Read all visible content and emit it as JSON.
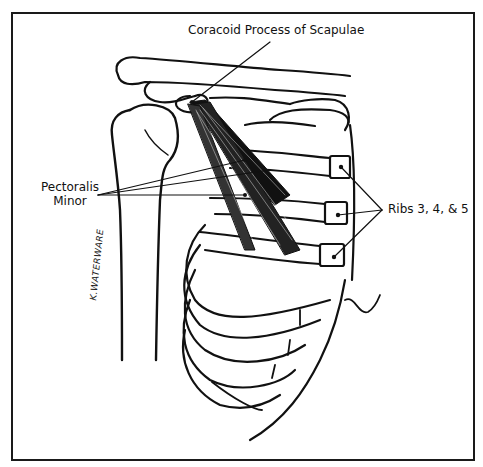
{
  "diagram": {
    "labels": {
      "coracoid": "Coracoid Process of Scapulae",
      "pectoralis_line1": "Pectoralis",
      "pectoralis_line2": "Minor",
      "ribs": "Ribs 3, 4, & 5"
    },
    "signature": "K.WATERWARE",
    "colors": {
      "ink": "#111111",
      "background": "#ffffff",
      "frame": "#1a1a1a"
    }
  }
}
